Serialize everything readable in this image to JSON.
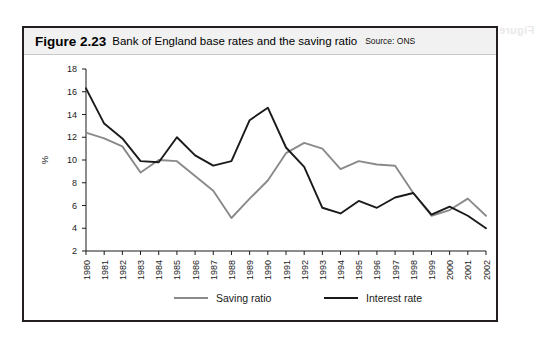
{
  "figure": {
    "number": "Figure 2.23",
    "title": "Bank of England base rates and the saving ratio",
    "source": "Source: ONS"
  },
  "colors": {
    "interest_rate": "#1a1a1a",
    "saving_ratio": "#8a8a8a",
    "border": "#231f20",
    "titlebar": "#f1f1f1"
  },
  "chart_data": {
    "type": "line",
    "title": "Bank of England base rates and the saving ratio",
    "xlabel": "",
    "ylabel": "%",
    "ylim": [
      2,
      18
    ],
    "ytick_step": 2,
    "yticks": [
      2,
      4,
      6,
      8,
      10,
      12,
      14,
      16,
      18
    ],
    "grid": false,
    "legend_position": "bottom",
    "categories": [
      "1980",
      "1981",
      "1982",
      "1983",
      "1984",
      "1985",
      "1986",
      "1987",
      "1988",
      "1989",
      "1990",
      "1991",
      "1992",
      "1993",
      "1994",
      "1995",
      "1996",
      "1997",
      "1998",
      "1999",
      "2000",
      "2001",
      "2002"
    ],
    "series": [
      {
        "name": "Saving ratio",
        "color": "#8a8a8a",
        "values": [
          12.4,
          11.9,
          11.2,
          8.9,
          10.0,
          9.9,
          8.6,
          7.3,
          4.9,
          6.6,
          8.2,
          10.6,
          11.5,
          11.0,
          9.2,
          9.9,
          9.6,
          9.5,
          7.1,
          5.1,
          5.6,
          6.6,
          5.1
        ]
      },
      {
        "name": "Interest rate",
        "color": "#1a1a1a",
        "values": [
          16.3,
          13.2,
          11.9,
          9.9,
          9.8,
          12.0,
          10.4,
          9.5,
          9.9,
          13.5,
          14.6,
          11.1,
          9.4,
          5.8,
          5.3,
          6.4,
          5.8,
          6.7,
          7.1,
          5.2,
          5.9,
          5.1,
          4.0
        ]
      }
    ]
  },
  "legend": [
    {
      "label": "Saving ratio"
    },
    {
      "label": "Interest rate"
    }
  ],
  "bleed": {
    "ghost_text": "Figure 2.23  Inflation"
  }
}
